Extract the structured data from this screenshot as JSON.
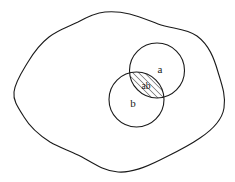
{
  "diagram": {
    "type": "venn-set-diagram",
    "background_color": "#ffffff",
    "stroke_color": "#1a1a1a",
    "hatch_color": "#1a1a1a",
    "universal_set": {
      "name": "universe-blob",
      "shape": "irregular closed wavy curve",
      "label": "",
      "stroke_width": 1.1
    },
    "circles": [
      {
        "id": "circle-a",
        "label": "a",
        "cx": 157,
        "cy": 70.5,
        "r": 27.5,
        "stroke_width": 1.1,
        "fill": "none"
      },
      {
        "id": "circle-b",
        "label": "b",
        "cx": 136.5,
        "cy": 99.5,
        "r": 27.5,
        "stroke_width": 1.1,
        "fill": "none"
      }
    ],
    "intersection": {
      "id": "intersection-ab",
      "label": "ab",
      "fill_pattern": "diagonal-hatch",
      "hatch_angle_degrees": 45,
      "hatch_spacing_px": 3,
      "center_x": 146,
      "center_y": 86
    },
    "labels": [
      {
        "id": "label-a",
        "text": "a",
        "x": 160,
        "y": 73
      },
      {
        "id": "label-b",
        "text": "b",
        "x": 133,
        "y": 107
      },
      {
        "id": "label-ab",
        "text": "ab",
        "x": 146,
        "y": 89
      }
    ]
  }
}
